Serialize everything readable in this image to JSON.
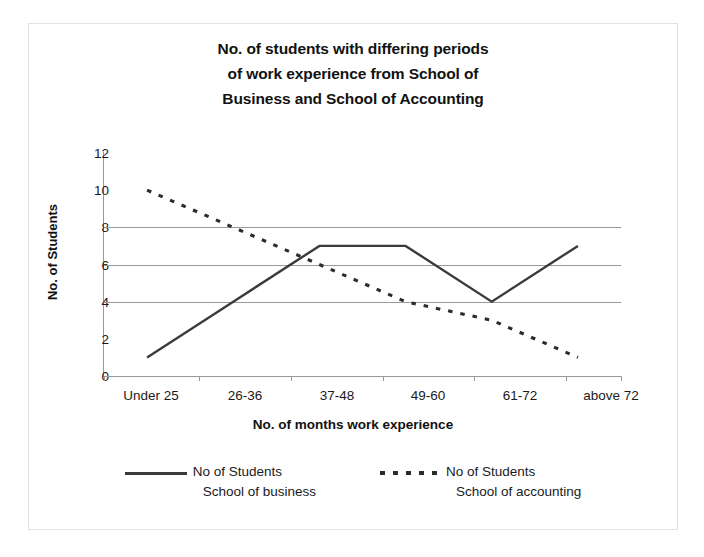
{
  "chart_data": {
    "type": "line",
    "title": "No. of students with differing periods of work experience from School of Business and School of Accounting",
    "title_lines": [
      "No. of students with differing periods",
      "of work experience from School of",
      "Business and School of Accounting"
    ],
    "xlabel": "No. of months work experience",
    "ylabel": "No. of Students",
    "categories": [
      "Under 25",
      "26-36",
      "37-48",
      "49-60",
      "61-72",
      "above 72"
    ],
    "series": [
      {
        "name": "No of Students School of business",
        "name_line1": "No of Students",
        "name_line2": "School of business",
        "style": "solid",
        "color": "#3b3b3b",
        "values": [
          1,
          4,
          7,
          7,
          4,
          7
        ]
      },
      {
        "name": "No of Students School of accounting",
        "name_line1": "No of Students",
        "name_line2": "School of accounting",
        "style": "dashed",
        "color": "#2b2b2b",
        "values": [
          10,
          8,
          6,
          4,
          3,
          1
        ]
      }
    ],
    "ylim": [
      0,
      12
    ],
    "y_ticks": [
      0,
      2,
      4,
      6,
      8,
      10,
      12
    ],
    "gridlines_at": [
      0,
      4,
      6,
      8
    ],
    "grid": true,
    "legend_position": "bottom"
  }
}
